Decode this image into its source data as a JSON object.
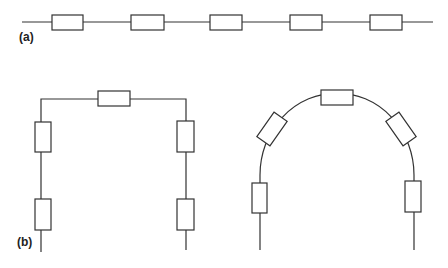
{
  "panels": [
    {
      "id": "a",
      "label": "(a)",
      "description": "Five resistors in series along a straight line"
    },
    {
      "id": "b",
      "label": "(b)",
      "description": "Five resistors in series bent into a rectangular arch and a rounded arch"
    }
  ],
  "colors": {
    "stroke": "#333333",
    "background": "#ffffff"
  },
  "resistor_count_per_chain": 5
}
